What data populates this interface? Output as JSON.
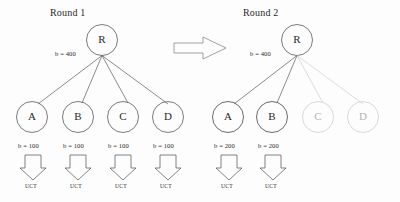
{
  "figure": {
    "type": "tree-diagram",
    "colors": {
      "stroke_active": "#5a5a5a",
      "stroke_dim": "#cfcfcf",
      "text_active": "#2a2a2a",
      "text_dim": "#b5b5b5",
      "background": "#fdfdfd"
    }
  },
  "panels": [
    {
      "id": "round-1",
      "title": "Round 1",
      "root": {
        "label": "R",
        "budget_label": "b = 400",
        "active": true
      },
      "children": [
        {
          "label": "A",
          "budget_label": "b = 100",
          "method_label": "UCT",
          "active": true
        },
        {
          "label": "B",
          "budget_label": "b = 100",
          "method_label": "UCT",
          "active": true
        },
        {
          "label": "C",
          "budget_label": "b = 100",
          "method_label": "UCT",
          "active": true
        },
        {
          "label": "D",
          "budget_label": "b = 100",
          "method_label": "UCT",
          "active": true
        }
      ]
    },
    {
      "id": "round-2",
      "title": "Round 2",
      "root": {
        "label": "R",
        "budget_label": "b = 400",
        "active": true
      },
      "children": [
        {
          "label": "A",
          "budget_label": "b = 200",
          "method_label": "UCT",
          "active": true
        },
        {
          "label": "B",
          "budget_label": "b = 200",
          "method_label": "UCT",
          "active": true
        },
        {
          "label": "C",
          "budget_label": "",
          "method_label": "",
          "active": false
        },
        {
          "label": "D",
          "budget_label": "",
          "method_label": "",
          "active": false
        }
      ]
    }
  ],
  "transition": {
    "icon": "right-arrow-icon",
    "label": ""
  }
}
